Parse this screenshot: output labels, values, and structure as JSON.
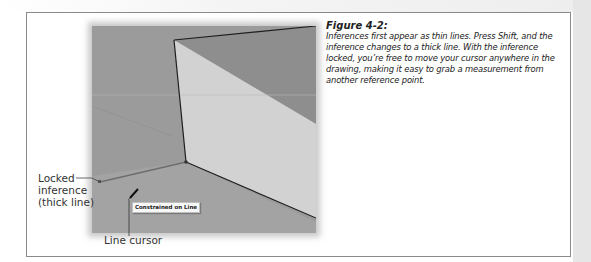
{
  "figure": {
    "number": "Figure 4-2:",
    "caption": "Inferences first appear as thin lines. Press Shift, and the inference changes to a thick line. With the inference locked, you’re free to move your cursor anywhere in the drawing, making it easy to grab a measurement from another reference point."
  },
  "callouts": {
    "locked_inference": [
      "Locked",
      "inference",
      "(thick line)"
    ],
    "line_cursor": "Line cursor"
  },
  "scene": {
    "tooltip": "Constrained on Line",
    "colors": {
      "background": "#9b9b9b",
      "box_front": "#d2d2d2",
      "box_top": "#8e8e8e",
      "edge": "#1e1e1e",
      "inference_line": "#6e6e6e"
    }
  }
}
